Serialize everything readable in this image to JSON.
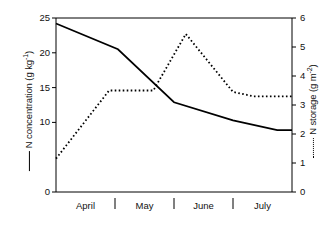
{
  "chart_data": {
    "type": "line",
    "title": "",
    "xlabel": "",
    "categories": [
      "April",
      "May",
      "June",
      "July"
    ],
    "x_tick_labels": [
      "April",
      "May",
      "June",
      "July"
    ],
    "grid": false,
    "legend_position": "axis-labels",
    "axes": {
      "left": {
        "label": "N concentration (g kg-1)",
        "label_text": "N concentration (g kg",
        "label_exp": "-1",
        "label_unit_open": "(g kg",
        "label_unit_close": ")",
        "ylim": [
          0,
          25
        ],
        "ticks": [
          0,
          10,
          15,
          20,
          25
        ],
        "tick_labels": [
          "0",
          "10",
          "15",
          "20",
          "25"
        ],
        "legend_style": "solid"
      },
      "right": {
        "label": "N storage (g m-2)",
        "label_text": "N storage (g m",
        "label_exp": "-2",
        "label_unit_close": ")",
        "ylim": [
          0,
          6
        ],
        "ticks": [
          0,
          1,
          2,
          3,
          4,
          5,
          6
        ],
        "tick_labels": [
          "0",
          "1",
          "2",
          "3",
          "4",
          "5",
          "6"
        ],
        "legend_style": "dotted"
      }
    },
    "series": [
      {
        "name": "N concentration",
        "axis": "left",
        "style": "solid",
        "color": "#000000",
        "x": [
          0.0,
          1.05,
          2.0,
          3.0,
          3.75,
          4.0
        ],
        "values": [
          24.2,
          20.5,
          12.9,
          10.3,
          8.9,
          8.9
        ]
      },
      {
        "name": "N storage",
        "axis": "right",
        "style": "dotted",
        "color": "#000000",
        "x": [
          0.0,
          0.9,
          1.65,
          2.2,
          3.0,
          3.35,
          4.0
        ],
        "values": [
          1.15,
          3.5,
          3.5,
          5.45,
          3.45,
          3.3,
          3.3
        ]
      }
    ]
  },
  "colors": {
    "axis": "#000000",
    "series": "#000000",
    "background": "#ffffff"
  }
}
